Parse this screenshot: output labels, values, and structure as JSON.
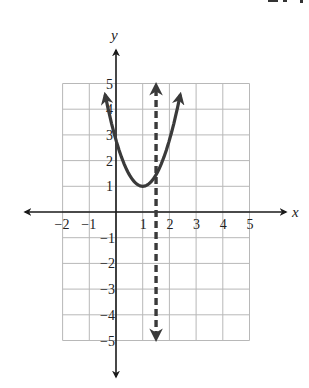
{
  "chart_data": {
    "type": "line",
    "title": "",
    "xlabel": "x",
    "ylabel": "y",
    "xlim": [
      -2,
      5
    ],
    "ylim": [
      -5,
      5
    ],
    "grid": true,
    "x_ticks": [
      -2,
      -1,
      1,
      2,
      3,
      4,
      5
    ],
    "y_ticks": [
      5,
      4,
      3,
      2,
      1,
      -1,
      -2,
      -3,
      -4,
      -5
    ],
    "series": [
      {
        "name": "parabola",
        "style": "solid",
        "equation_form": "y = a(x - 1)^2 + 1",
        "vertex": [
          1,
          1
        ],
        "a": 1.8,
        "x_range": [
          -0.4,
          2.4
        ],
        "points": [
          [
            -0.37,
            4.9
          ],
          [
            0,
            2.8
          ],
          [
            1,
            1
          ],
          [
            2,
            2.8
          ],
          [
            2.3,
            4.9
          ]
        ],
        "arrows": "both ends"
      },
      {
        "name": "vertical dashed line",
        "style": "dashed",
        "equation": "x = 1.5",
        "x": 1.5,
        "y_range": [
          -4.9,
          4.9
        ],
        "arrows": "both ends"
      }
    ],
    "colors": {
      "curve": "#3a3a3a",
      "axis": "#1a1a1a",
      "grid": "#b8b8b8"
    }
  },
  "layout": {
    "origin_px": [
      116,
      212
    ],
    "unit_x_px": 26.7,
    "unit_y_px": 25.7
  }
}
